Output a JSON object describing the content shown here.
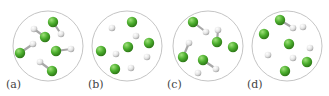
{
  "figure": {
    "colors": {
      "green_atom": "#4caf2e",
      "white_atom": "#e4e4e4",
      "circle_outline": "#bdbdbd",
      "bond": "#a8a8a8"
    },
    "panels": [
      {
        "label": "(a)",
        "center": [
          48,
          46
        ],
        "radius": 35,
        "green": [
          [
            53,
            22
          ],
          [
            45,
            37
          ],
          [
            20,
            53
          ],
          [
            56,
            51
          ],
          [
            52,
            71
          ]
        ],
        "white": [
          [
            34,
            29
          ],
          [
            61,
            34
          ],
          [
            33,
            44
          ],
          [
            71,
            49
          ],
          [
            40,
            62
          ]
        ],
        "bonds": [
          [
            [
              53,
              22
            ],
            [
              61,
              34
            ]
          ],
          [
            [
              34,
              29
            ],
            [
              45,
              37
            ]
          ],
          [
            [
              33,
              44
            ],
            [
              20,
              53
            ]
          ],
          [
            [
              56,
              51
            ],
            [
              71,
              49
            ]
          ],
          [
            [
              40,
              62
            ],
            [
              52,
              71
            ]
          ]
        ]
      },
      {
        "label": "(b)",
        "center": [
          127,
          46
        ],
        "radius": 35,
        "green": [
          [
            132,
            22
          ],
          [
            101,
            51
          ],
          [
            128,
            47
          ],
          [
            149,
            43
          ],
          [
            115,
            69
          ]
        ],
        "white": [
          [
            112,
            28
          ],
          [
            136,
            36
          ],
          [
            116,
            54
          ],
          [
            147,
            57
          ],
          [
            131,
            68
          ]
        ],
        "bonds": []
      },
      {
        "label": "(c)",
        "center": [
          208,
          46
        ],
        "radius": 35,
        "green": [
          [
            193,
            22
          ],
          [
            217,
            42
          ],
          [
            233,
            47
          ],
          [
            183,
            57
          ],
          [
            203,
            60
          ]
        ],
        "white": [
          [
            206,
            32
          ],
          [
            218,
            30
          ],
          [
            189,
            43
          ],
          [
            216,
            69
          ],
          [
            198,
            73
          ]
        ],
        "bonds": [
          [
            [
              193,
              22
            ],
            [
              206,
              32
            ]
          ],
          [
            [
              218,
              30
            ],
            [
              217,
              42
            ]
          ],
          [
            [
              189,
              43
            ],
            [
              183,
              57
            ]
          ],
          [
            [
              203,
              60
            ],
            [
              216,
              69
            ]
          ]
        ]
      },
      {
        "label": "(d)",
        "center": [
          287,
          46
        ],
        "radius": 35,
        "green": [
          [
            280,
            20
          ],
          [
            264,
            34
          ],
          [
            289,
            44
          ],
          [
            307,
            62
          ],
          [
            285,
            71
          ]
        ],
        "white": [
          [
            293,
            28
          ],
          [
            303,
            27
          ],
          [
            310,
            48
          ],
          [
            268,
            55
          ],
          [
            293,
            58
          ]
        ],
        "bonds": [
          [
            [
              280,
              20
            ],
            [
              293,
              28
            ]
          ]
        ]
      }
    ]
  }
}
